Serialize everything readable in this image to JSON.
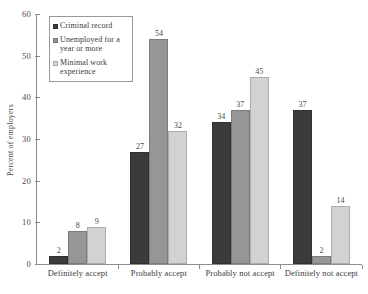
{
  "chart_data": {
    "type": "bar",
    "title": "",
    "subtitle": "",
    "xlabel": "",
    "ylabel": "Percent of employers",
    "ylim": [
      0,
      60
    ],
    "yticks": [
      0,
      10,
      20,
      30,
      40,
      50,
      60
    ],
    "grid": false,
    "legend_position": "upper-left-inside",
    "categories": [
      "Definitely accept",
      "Probably accept",
      "Probably not accept",
      "Definitely not accept"
    ],
    "series": [
      {
        "name": "Criminal record",
        "color": "#3b3b3b",
        "values": [
          2,
          27,
          34,
          37
        ]
      },
      {
        "name": "Unemployed for a year or more",
        "color": "#969696",
        "values": [
          8,
          54,
          37,
          2
        ]
      },
      {
        "name": "Minimal work experience",
        "color": "#d2d2d2",
        "values": [
          9,
          32,
          45,
          14
        ]
      }
    ],
    "data_labels": true
  },
  "axis": {
    "y_tick_labels": [
      "60",
      "50",
      "40",
      "30",
      "20",
      "10",
      "0"
    ],
    "y_title": "Percent of employers"
  },
  "legend": {
    "items": [
      {
        "label": "Criminal record"
      },
      {
        "label": "Unemployed for a year or more"
      },
      {
        "label": "Minimal work experience"
      }
    ]
  }
}
